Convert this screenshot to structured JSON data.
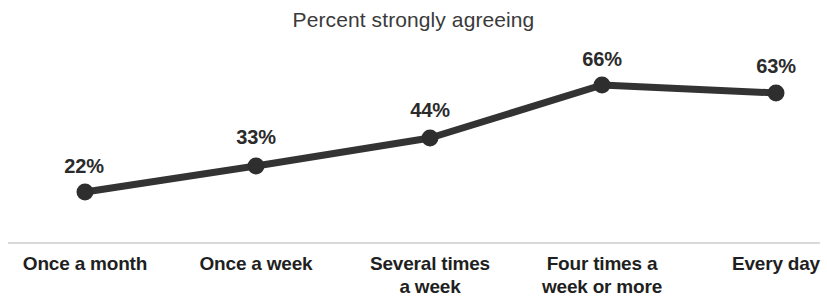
{
  "chart_data": {
    "type": "line",
    "title": "Percent strongly agreeing",
    "xlabel": "",
    "ylabel": "",
    "grid": false,
    "legend": false,
    "ylim": [
      0,
      75
    ],
    "categories": [
      "Once a month",
      "Once a week",
      "Several times a week",
      "Four times a week or more",
      "Every day"
    ],
    "category_lines": [
      [
        "Once a month",
        ""
      ],
      [
        "Once a week",
        ""
      ],
      [
        "Several times",
        "a week"
      ],
      [
        "Four times a",
        "week or more"
      ],
      [
        "Every day",
        ""
      ]
    ],
    "values": [
      22,
      33,
      44,
      66,
      63
    ],
    "data_labels": [
      "22%",
      "33%",
      "44%",
      "66%",
      "63%"
    ],
    "series": [
      {
        "name": "Percent strongly agreeing",
        "values": [
          22,
          33,
          44,
          66,
          63
        ]
      }
    ],
    "colors": {
      "line": "#333333",
      "marker": "#2e2e2e",
      "axis": "#d9d9d9",
      "text": "#2b2b2b",
      "title": "#3a3a3a",
      "background": "#ffffff"
    },
    "points_px": [
      {
        "x": 85,
        "y": 192,
        "label_x": 84,
        "label_y": 155
      },
      {
        "x": 256,
        "y": 166,
        "label_x": 256,
        "label_y": 126
      },
      {
        "x": 430,
        "y": 138,
        "label_x": 430,
        "label_y": 99
      },
      {
        "x": 602,
        "y": 85,
        "label_x": 602,
        "label_y": 48
      },
      {
        "x": 776,
        "y": 93,
        "label_x": 776,
        "label_y": 55
      }
    ],
    "axis_line_px": {
      "x1": 8,
      "x2": 820,
      "y": 243
    }
  }
}
